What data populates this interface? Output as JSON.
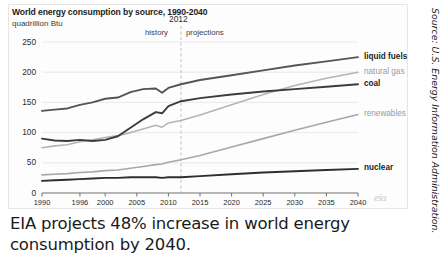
{
  "chart_data": {
    "type": "line",
    "title": "World energy consumption by source, 1990-2040",
    "subtitle": "quadrillion Btu",
    "ylabel": "quadrillion Btu",
    "xlabel": "",
    "ylim": [
      0,
      250
    ],
    "xlim": [
      1990,
      2040
    ],
    "yticks": [
      "0",
      "50",
      "100",
      "150",
      "200",
      "250"
    ],
    "ytick_values": [
      0,
      50,
      100,
      150,
      200,
      250
    ],
    "xticks": [
      "1990",
      "1996",
      "2000",
      "2005",
      "2010",
      "2015",
      "2020",
      "2025",
      "2030",
      "2035",
      "2040"
    ],
    "xtick_values": [
      1990,
      1996,
      2000,
      2005,
      2010,
      2015,
      2020,
      2025,
      2030,
      2035,
      2040
    ],
    "grid": true,
    "legend_position": "right-inline",
    "divider": {
      "year": 2012,
      "label": "2012",
      "left_label": "history",
      "right_label": "projections"
    },
    "x": [
      1990,
      1992,
      1994,
      1996,
      1998,
      2000,
      2002,
      2004,
      2006,
      2008,
      2009,
      2010,
      2012,
      2015,
      2020,
      2025,
      2030,
      2035,
      2040
    ],
    "series": [
      {
        "name": "liquid fuels",
        "label": "liquid fuels",
        "color": "#555555",
        "emphasis": "dark",
        "values": [
          136,
          138,
          140,
          146,
          150,
          156,
          158,
          167,
          172,
          173,
          166,
          174,
          180,
          187,
          195,
          203,
          211,
          218,
          225
        ]
      },
      {
        "name": "natural gas",
        "label": "natural gas",
        "color": "#b4b4b4",
        "emphasis": "light",
        "values": [
          75,
          78,
          80,
          85,
          88,
          92,
          95,
          100,
          106,
          112,
          109,
          116,
          120,
          129,
          146,
          163,
          178,
          190,
          200
        ]
      },
      {
        "name": "coal",
        "label": "coal",
        "color": "#3c3c3c",
        "emphasis": "dark",
        "values": [
          90,
          87,
          86,
          88,
          86,
          88,
          94,
          108,
          122,
          134,
          132,
          144,
          152,
          157,
          163,
          168,
          172,
          176,
          180
        ]
      },
      {
        "name": "renewables",
        "label": "renewables",
        "color": "#a8a8a8",
        "emphasis": "light",
        "values": [
          30,
          31,
          32,
          34,
          35,
          37,
          38,
          41,
          44,
          47,
          48,
          51,
          55,
          62,
          76,
          90,
          104,
          117,
          130
        ]
      },
      {
        "name": "nuclear",
        "label": "nuclear",
        "color": "#2e2e2e",
        "emphasis": "dark",
        "values": [
          20,
          21,
          22,
          23,
          24,
          25,
          25,
          26,
          26,
          26,
          25,
          26,
          26,
          28,
          31,
          34,
          36,
          38,
          40
        ]
      }
    ]
  },
  "caption": "EIA projects 48% increase in world energy consumption by 2040.",
  "source_note": "Source: U.S. Energy Information Administration.",
  "logo": {
    "text": "eia"
  }
}
